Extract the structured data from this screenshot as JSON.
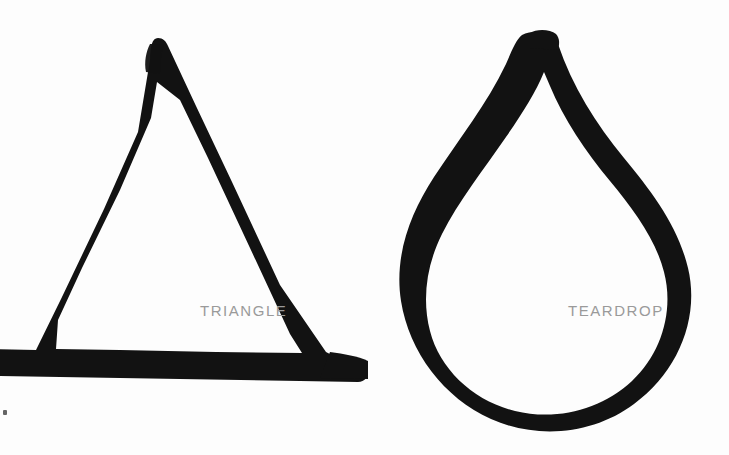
{
  "page": {
    "background_color": "#fdfdfd",
    "ink_color": "#111111",
    "label_color": "#9a9a9a",
    "width": 729,
    "height": 455
  },
  "shapes": [
    {
      "name": "triangle",
      "label": "TRIANGLE",
      "style": "hand-drawn marker outline",
      "stroke_color": "#111111",
      "filled": false,
      "label_position": "inside lower-right"
    },
    {
      "name": "teardrop",
      "label": "TEARDROP",
      "style": "hand-drawn marker outline",
      "stroke_color": "#111111",
      "filled": false,
      "label_position": "inside lower-right"
    }
  ],
  "artifacts": {
    "speck": "ink-speck"
  }
}
